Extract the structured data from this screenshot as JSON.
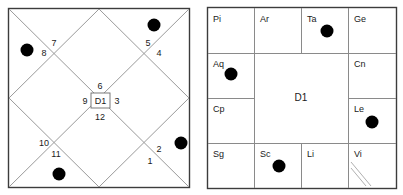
{
  "page": {
    "width": 403,
    "height": 195,
    "background": "#ffffff"
  },
  "colors": {
    "dot": "#000000",
    "outer_frame": "#3c3c3c",
    "grid": "#8a8a8a",
    "diagonal": "#9a9a9a",
    "text": "#1a1a1a"
  },
  "north_chart": {
    "name": "north-indian-diamond-chart",
    "center_label": "D1",
    "frame": {
      "x": 8,
      "y": 8,
      "width": 182,
      "height": 180
    },
    "house_numbers": [
      {
        "label": "1",
        "x": 150,
        "y": 164
      },
      {
        "label": "2",
        "x": 158,
        "y": 152
      },
      {
        "label": "3",
        "x": 115,
        "y": 101
      },
      {
        "label": "4",
        "x": 158,
        "y": 55
      },
      {
        "label": "5",
        "x": 148,
        "y": 45
      },
      {
        "label": "6",
        "x": 99,
        "y": 86
      },
      {
        "label": "7",
        "x": 55,
        "y": 45
      },
      {
        "label": "8",
        "x": 45,
        "y": 55
      },
      {
        "label": "9",
        "x": 86,
        "y": 101
      },
      {
        "label": "10",
        "x": 44,
        "y": 146
      },
      {
        "label": "11",
        "x": 55,
        "y": 157
      },
      {
        "label": "12",
        "x": 99,
        "y": 117
      }
    ],
    "planet_dots": [
      {
        "name": "dot-top-right",
        "cx": 154,
        "cy": 25,
        "r": 6.5
      },
      {
        "name": "dot-left",
        "cx": 27,
        "cy": 50,
        "r": 6.5
      },
      {
        "name": "dot-right",
        "cx": 181,
        "cy": 143,
        "r": 6.5
      },
      {
        "name": "dot-bottom",
        "cx": 59,
        "cy": 174,
        "r": 6.5
      }
    ]
  },
  "south_chart": {
    "name": "south-indian-square-chart",
    "center_label": "D1",
    "frame": {
      "x": 207,
      "y": 7,
      "width": 190,
      "height": 182
    },
    "cells": [
      {
        "sign": "Pi",
        "row": 0,
        "col": 0
      },
      {
        "sign": "Ar",
        "row": 0,
        "col": 1
      },
      {
        "sign": "Ta",
        "row": 0,
        "col": 2
      },
      {
        "sign": "Ge",
        "row": 0,
        "col": 3
      },
      {
        "sign": "Aq",
        "row": 1,
        "col": 0
      },
      {
        "sign": "Cn",
        "row": 1,
        "col": 3
      },
      {
        "sign": "Cp",
        "row": 2,
        "col": 0
      },
      {
        "sign": "Le",
        "row": 2,
        "col": 3
      },
      {
        "sign": "Sg",
        "row": 3,
        "col": 0
      },
      {
        "sign": "Sc",
        "row": 3,
        "col": 1
      },
      {
        "sign": "Li",
        "row": 3,
        "col": 2
      },
      {
        "sign": "Vi",
        "row": 3,
        "col": 3
      }
    ],
    "planet_dots": [
      {
        "name": "dot-taurus",
        "sign": "Ta",
        "cx": 327,
        "cy": 31,
        "r": 6.5
      },
      {
        "name": "dot-aquarius",
        "sign": "Aq",
        "cx": 231,
        "cy": 74,
        "r": 6.5
      },
      {
        "name": "dot-leo",
        "sign": "Le",
        "cx": 372,
        "cy": 122,
        "r": 6.5
      },
      {
        "name": "dot-scorpio",
        "sign": "Sc",
        "cx": 279,
        "cy": 166,
        "r": 6.5
      }
    ],
    "corner_grip": {
      "name": "resize-grip",
      "visible": true
    }
  }
}
